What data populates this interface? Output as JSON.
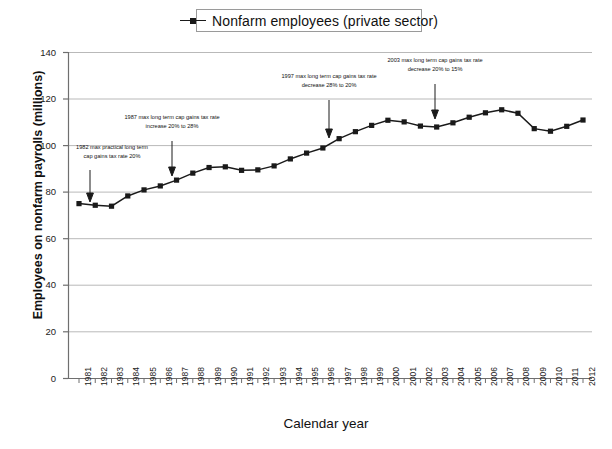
{
  "chart_data": {
    "type": "line",
    "title": "",
    "xlabel": "Calendar year",
    "ylabel": "Employees on nonfarm payrolls (millions)",
    "legend": [
      "Nonfarm employees (private sector)"
    ],
    "legend_position": "top-center",
    "grid": true,
    "xlim": [
      1981,
      2012
    ],
    "ylim": [
      0,
      140
    ],
    "yticks": [
      0,
      20,
      40,
      60,
      80,
      100,
      120,
      140
    ],
    "categories": [
      "1981",
      "1982",
      "1983",
      "1984",
      "1985",
      "1986",
      "1987",
      "1988",
      "1989",
      "1990",
      "1991",
      "1992",
      "1993",
      "1994",
      "1995",
      "1996",
      "1997",
      "1998",
      "1999",
      "2000",
      "2001",
      "2002",
      "2003",
      "2004",
      "2005",
      "2006",
      "2007",
      "2008",
      "2009",
      "2010",
      "2011",
      "2012"
    ],
    "series": [
      {
        "name": "Nonfarm employees (private sector)",
        "marker": "square",
        "color": "#1a1a1a",
        "values": [
          75.1,
          74.4,
          74.0,
          78.4,
          81.0,
          82.7,
          85.2,
          88.2,
          90.6,
          90.9,
          89.4,
          89.6,
          91.3,
          94.3,
          96.8,
          99.0,
          103.0,
          106.0,
          108.7,
          110.9,
          110.2,
          108.4,
          108.0,
          109.8,
          112.2,
          114.1,
          115.4,
          113.9,
          107.3,
          106.2,
          108.3,
          111.0
        ]
      }
    ],
    "annotations": [
      {
        "id": "annot-1982",
        "lines": [
          "1982 max practical long term",
          "cap gains tax rate 20%"
        ],
        "points_to_year": "1982"
      },
      {
        "id": "annot-1987",
        "lines": [
          "1987 max long term cap gains tax rate",
          "increase 20% to 28%"
        ],
        "points_to_year": "1987"
      },
      {
        "id": "annot-1997",
        "lines": [
          "1997 max long term cap gains tax rate",
          "decrease 28% to 20%"
        ],
        "points_to_year": "1997"
      },
      {
        "id": "annot-2003",
        "lines": [
          "2003 max long term cap gains tax rate",
          "decrease 20% to 15%"
        ],
        "points_to_year": "2003"
      }
    ]
  },
  "legend": {
    "label": "Nonfarm employees (private sector)"
  },
  "axes": {
    "y_title": "Employees on nonfarm payrolls (millions)",
    "x_title": "Calendar year",
    "y_ticks": [
      "140",
      "120",
      "100",
      "80",
      "60",
      "40",
      "20",
      "0"
    ],
    "x_ticks": [
      "1981",
      "1982",
      "1983",
      "1984",
      "1985",
      "1986",
      "1987",
      "1988",
      "1989",
      "1990",
      "1991",
      "1992",
      "1993",
      "1994",
      "1995",
      "1996",
      "1997",
      "1998",
      "1999",
      "2000",
      "2001",
      "2002",
      "2003",
      "2004",
      "2005",
      "2006",
      "2007",
      "2008",
      "2009",
      "2010",
      "2011",
      "2012"
    ]
  },
  "annotations": {
    "a1_line1": "1982 max practical long term",
    "a1_line2": "cap gains tax rate 20%",
    "a2_line1": "1987 max long term cap gains tax rate",
    "a2_line2": "increase 20% to 28%",
    "a3_line1": "1997 max long term cap gains tax rate",
    "a3_line2": "decrease 28% to 20%",
    "a4_line1": "2003 max long term cap gains tax rate",
    "a4_line2": "decrease 20% to 15%"
  },
  "colors": {
    "series": "#1a1a1a",
    "grid": "#b9b9b9",
    "axis": "#6f6f6f",
    "background": "#ffffff"
  }
}
